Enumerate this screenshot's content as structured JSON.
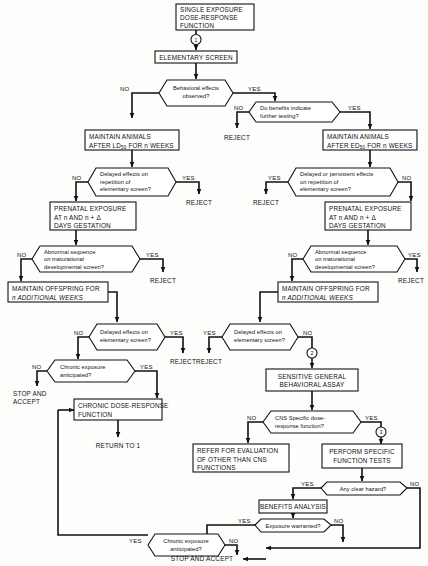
{
  "diagram": {
    "accent_color": "#111111",
    "background_color": "#fdfdfc"
  },
  "nodes": {
    "single_exposure": {
      "line1": "SINGLE EXPOSURE",
      "line2": "DOSE-RESPONSE",
      "line3": "FUNCTION"
    },
    "elementary_screen": {
      "label": "ELEMENTARY SCREEN"
    },
    "behavioral_effects": {
      "line1": "Behavioral effects",
      "line2": "observed?"
    },
    "do_benefits": {
      "line1": "Do benefits indicate",
      "line2": "further testing?"
    },
    "maintain_ld50": {
      "line1": "MAINTAIN ANIMALS",
      "line2_pre": "AFTER LD",
      "line2_sub": "50",
      "line2_post": " FOR n WEEKS"
    },
    "maintain_ed50": {
      "line1": "MAINTAIN ANIMALS",
      "line2_pre": "AFTER ED",
      "line2_sub": "50",
      "line2_post": " FOR n WEEKS"
    },
    "delayed_repetition_left": {
      "line1": "Delayed effects on",
      "line2": "repetition of",
      "line3": "elementary screen?"
    },
    "delayed_repetition_right": {
      "line1": "Delayed or persistent effects",
      "line2": "on repetition of",
      "line3": "elementary screen?"
    },
    "prenatal_left": {
      "line1": "PRENATAL EXPOSURE",
      "line2": "AT n AND n + Δ",
      "line3": "DAYS GESTATION"
    },
    "prenatal_right": {
      "line1": "PRENATAL EXPOSURE",
      "line2": "AT n AND n + Δ",
      "line3": "DAYS GESTATION"
    },
    "abnormal_left": {
      "line1": "Abnormal sequence",
      "line2": "on maturational",
      "line3": "developmental screen?"
    },
    "abnormal_right": {
      "line1": "Abnormal sequence",
      "line2": "on maturational",
      "line3": "developmental screen?"
    },
    "offspring_left": {
      "line1": "MAINTAIN OFFSPRING FOR",
      "line2": "n ADDITIONAL WEEKS"
    },
    "offspring_right": {
      "line1": "MAINTAIN OFFSPRING FOR",
      "line2": "n ADDITIONAL WEEKS"
    },
    "delayed_elem_left": {
      "line1": "Delayed effects on",
      "line2": "elementary screen?"
    },
    "delayed_elem_right": {
      "line1": "Delayed effects on",
      "line2": "elementary screen?"
    },
    "chronic_anticipated_left": {
      "line1": "Chronic exposure",
      "line2": "anticipated?"
    },
    "chronic_anticipated_bottom": {
      "line1": "Chronic exposure",
      "line2": "anticipated?"
    },
    "chronic_dose_response": {
      "line1": "CHRONIC DOSE-RESPONSE",
      "line2": "FUNCTION"
    },
    "sensitive_assay": {
      "line1": "SENSITIVE GENERAL",
      "line2": "BEHAVIORAL ASSAY"
    },
    "cns_specific": {
      "line1": "CNS Specific dose-",
      "line2": "response function?"
    },
    "refer_evaluation": {
      "line1": "REFER FOR EVALUATION",
      "line2": "OF OTHER THAN CNS",
      "line3": "FUNCTIONS"
    },
    "perform_tests": {
      "line1": "PERFORM SPECIFIC",
      "line2": "FUNCTION TESTS"
    },
    "any_clear_hazard": {
      "label": "Any clear hazard?"
    },
    "benefits_analysis": {
      "label": "BENEFITS ANALYSIS"
    },
    "exposure_warranted": {
      "label": "Exposure warranted?"
    }
  },
  "terminals": {
    "reject_1": "REJECT",
    "reject_2": "REJECT",
    "reject_3": "REJECT",
    "reject_4": "REJECT",
    "reject_5": "REJECT",
    "reject_6": "REJECT",
    "reject_7": "REJECT",
    "reject_8": "REJECT",
    "stop_accept_left_1": "STOP AND",
    "stop_accept_left_2": "ACCEPT",
    "return_to_1": "RETURN TO  1",
    "stop_accept_bottom": "STOP AND ACCEPT"
  },
  "connectors": {
    "c1": "1",
    "c2a": "2",
    "c2b": "2",
    "c3": "3"
  },
  "edge_labels": {
    "behavioral_no": "NO",
    "behavioral_yes": "YES",
    "benefits_no": "NO",
    "benefits_yes": "YES",
    "delayed_rep_left_no": "NO",
    "delayed_rep_left_yes": "YES",
    "delayed_rep_right_yes": "YES",
    "delayed_rep_right_no": "NO",
    "abnormal_left_no": "NO",
    "abnormal_left_yes": "YES",
    "abnormal_right_no": "NO",
    "abnormal_right_yes": "YES",
    "delayed_elem_left_no": "NO",
    "delayed_elem_left_yes": "YES",
    "delayed_elem_right_yes": "YES",
    "delayed_elem_right_no": "NO",
    "chronic_left_no": "NO",
    "chronic_left_yes": "YES",
    "cns_no": "NO",
    "cns_yes": "YES",
    "hazard_yes": "YES",
    "hazard_no": "NO",
    "warranted_yes": "YES",
    "warranted_no": "NO",
    "chronic_bottom_yes": "YES",
    "chronic_bottom_no": "NO"
  }
}
